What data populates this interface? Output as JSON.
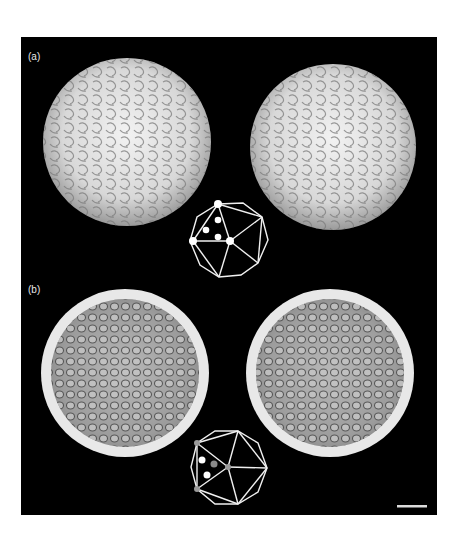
{
  "figure": {
    "panels": [
      {
        "label": "(a)",
        "description": "Surface-shaded virus capsid reconstruction, stereo pair (outer surface)",
        "icosahedron_markers": {
          "filled_vertices": 3,
          "interior_dots": 3,
          "marker_color": "#ffffff"
        }
      },
      {
        "label": "(b)",
        "description": "Cut-away view of capsid interior, stereo pair",
        "icosahedron_markers": {
          "filled_vertices": 3,
          "interior_dots": 3,
          "marker_color": "#bbbbbb"
        }
      }
    ],
    "scale_bar": {
      "label": ""
    },
    "colors": {
      "background": "#000000",
      "surface_light": "#e6e6e6",
      "surface_shadow": "#6a6a6a",
      "interior": "#a8a8a8",
      "rim": "#eeeeee",
      "diagram_line": "#f0f0f0"
    }
  }
}
